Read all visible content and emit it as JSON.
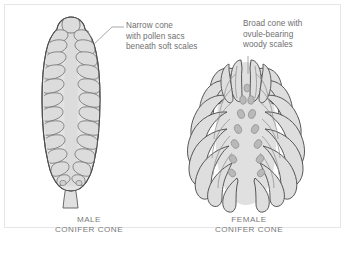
{
  "figure": {
    "kind": "botanical-diagram",
    "background_color": "#ffffff",
    "frame_color": "#e6e6e6"
  },
  "colors": {
    "outline": "#4f4f4f",
    "inner_line": "#8a8a8a",
    "cone_fill": "#e3e3e3",
    "scale_fill": "#dcdcdc",
    "axis_fill": "#dedede",
    "ovule_fill": "#b9b9b9",
    "ovule_stroke": "#8f8f8f",
    "text": "#6f6f6f",
    "caption_text": "#7a7a7a",
    "leader_line": "#9a9a9a"
  },
  "annotations": [
    {
      "id": "male",
      "lines": [
        "Narrow cone",
        "with pollen sacs",
        "beneath soft scales"
      ],
      "leader": "diagonal-down-left"
    },
    {
      "id": "female",
      "lines": [
        "Broad cone with",
        "ovule-bearing",
        "woody scales"
      ],
      "leader": "vertical-down"
    }
  ],
  "annotation_male": {
    "line1": "Narrow cone",
    "line2": "with pollen sacs",
    "line3": "beneath soft scales"
  },
  "annotation_female": {
    "line1": "Broad cone with",
    "line2": "ovule-bearing",
    "line3": "woody scales"
  },
  "captions": {
    "male": {
      "line1": "MALE",
      "line2": "CONIFER CONE"
    },
    "female": {
      "line1": "FEMALE",
      "line2": "CONIFER CONE"
    }
  },
  "specimens": [
    {
      "id": "male-conifer-cone",
      "label": "MALE CONIFER CONE",
      "shape": "narrow elongated ovoid with stalk",
      "scale_rows": 11,
      "scale_style": "soft overlapping rounded scales",
      "has_stalk": true,
      "ovule_count": 0
    },
    {
      "id": "female-conifer-cone",
      "label": "FEMALE CONIFER CONE",
      "shape": "broad rounded with radiating woody scales",
      "scale_rows": 9,
      "scale_style": "woody elongated recurved scales",
      "has_stalk": false,
      "ovule_count": 13
    }
  ]
}
